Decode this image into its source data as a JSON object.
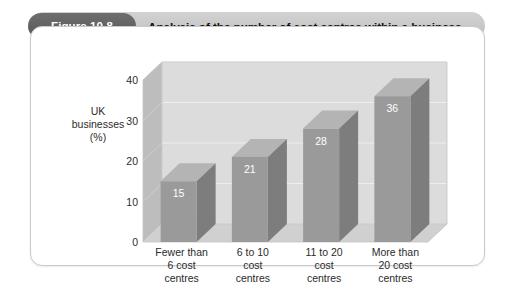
{
  "figure": {
    "badge_label": "Figure 10.8",
    "title": "Analysis of the number of cost centres within a business"
  },
  "colors": {
    "badge_bg": "#5f5f5f",
    "title_band_bg": "#c8c8c8",
    "card_border": "#c9c9c9",
    "back_wall": "#dcdcdc",
    "left_wall": "#bdbdbd",
    "floor": "#d0d0d0",
    "bar_front": "#9a9a9a",
    "bar_side": "#7d7d7d",
    "bar_top": "#b4b4b4",
    "gridline": "#eeeeee",
    "text": "#2b2b2b",
    "value_text": "#ffffff"
  },
  "chart_data": {
    "type": "bar",
    "title": "Analysis of the number of cost centres within a business",
    "xlabel": "",
    "ylabel": "UK businesses (%)",
    "ylabel_lines": [
      "UK",
      "businesses",
      "(%)"
    ],
    "categories": [
      "Fewer than 6 cost centres",
      "6 to 10 cost centres",
      "11 to 20 cost centres",
      "More than 20 cost centres"
    ],
    "category_lines": [
      [
        "Fewer than",
        "6 cost",
        "centres"
      ],
      [
        "6 to 10",
        "cost",
        "centres"
      ],
      [
        "11 to 20",
        "cost",
        "centres"
      ],
      [
        "More than",
        "20 cost",
        "centres"
      ]
    ],
    "values": [
      15,
      21,
      28,
      36
    ],
    "value_labels": [
      "15",
      "21",
      "28",
      "36"
    ],
    "ylim": [
      0,
      40
    ],
    "yticks": [
      0,
      10,
      20,
      30,
      40
    ],
    "ytick_labels": [
      "0",
      "10",
      "20",
      "30",
      "40"
    ],
    "grid": true,
    "legend": false,
    "three_d": true
  }
}
